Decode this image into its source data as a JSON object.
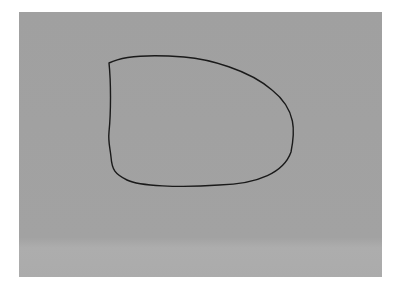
{
  "scene": {
    "description": "Photograph of a gray sheet of paper with a hand-drawn black oval",
    "background_color": "#ffffff",
    "paper_color": "#a1a1a1",
    "stroke_color": "#1a1a1a"
  },
  "shapes": [
    {
      "type": "hand-drawn-oval",
      "bbox": [
        110,
        57,
        295,
        186
      ]
    }
  ]
}
